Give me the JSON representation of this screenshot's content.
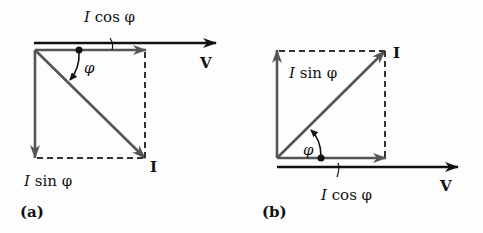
{
  "diagram": {
    "panels": [
      {
        "id": "a",
        "caption": "(a)",
        "reference_label": "V",
        "current_label": "I",
        "cos_label_I": "I",
        "cos_label_rest": " cos φ",
        "sin_label_I": "I",
        "sin_label_rest": " sin φ",
        "angle_label": "φ"
      },
      {
        "id": "b",
        "caption": "(b)",
        "reference_label": "V",
        "current_label": "I",
        "cos_label_I": "I",
        "cos_label_rest": " cos φ",
        "sin_label_I": "I",
        "sin_label_rest": " sin φ",
        "angle_label": "φ"
      }
    ],
    "colors": {
      "vector": "#555555",
      "axis": "#111111",
      "dashed": "#333333"
    }
  }
}
